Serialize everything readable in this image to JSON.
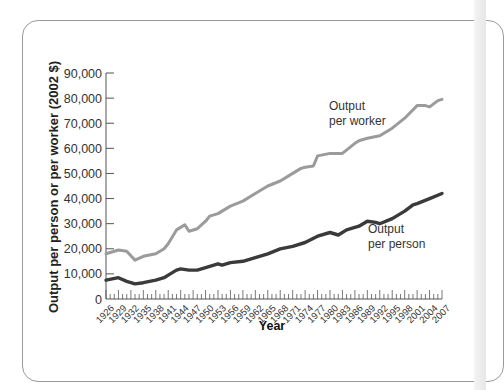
{
  "chart_data": {
    "type": "line",
    "title": "",
    "xlabel": "Year",
    "ylabel": "Output per person or per worker (2002 $)",
    "ylim": [
      0,
      90000
    ],
    "xlim": [
      1926,
      2007
    ],
    "grid": false,
    "y_ticks": [
      "0",
      "10,000",
      "20,000",
      "30,000",
      "40,000",
      "50,000",
      "60,000",
      "70,000",
      "80,000",
      "90,000"
    ],
    "x_ticks": [
      "1926",
      "1929",
      "1932",
      "1935",
      "1938",
      "1941",
      "1944",
      "1947",
      "1950",
      "1953",
      "1956",
      "1959",
      "1962",
      "1965",
      "1968",
      "1971",
      "1974",
      "1977",
      "1980",
      "1983",
      "1986",
      "1989",
      "1992",
      "1995",
      "1998",
      "2001",
      "2004",
      "2007"
    ],
    "series": [
      {
        "name": "Output per worker",
        "label_lines": [
          "Output",
          "per worker"
        ],
        "color": "#9b9b9b",
        "x": [
          1926,
          1929,
          1931,
          1933,
          1935,
          1938,
          1940,
          1941,
          1943,
          1945,
          1946,
          1948,
          1950,
          1951,
          1953,
          1954,
          1956,
          1959,
          1962,
          1965,
          1968,
          1971,
          1973,
          1974,
          1976,
          1977,
          1980,
          1983,
          1986,
          1987,
          1989,
          1992,
          1995,
          1998,
          2001,
          2003,
          2004,
          2006,
          2007
        ],
        "values": [
          18000,
          19500,
          19000,
          15500,
          17000,
          18000,
          20000,
          22000,
          27500,
          29500,
          27000,
          28000,
          31000,
          33000,
          34000,
          35000,
          37000,
          39000,
          42000,
          45000,
          47000,
          50000,
          52000,
          52500,
          53000,
          57000,
          58000,
          58000,
          62000,
          63000,
          64000,
          65000,
          68000,
          72000,
          77000,
          77000,
          76500,
          79000,
          79500
        ]
      },
      {
        "name": "Output per person",
        "label_lines": [
          "Output",
          "per person"
        ],
        "color": "#3a3a3a",
        "x": [
          1926,
          1929,
          1931,
          1933,
          1935,
          1938,
          1940,
          1941,
          1943,
          1944,
          1946,
          1948,
          1950,
          1953,
          1954,
          1956,
          1959,
          1962,
          1965,
          1968,
          1971,
          1974,
          1977,
          1980,
          1982,
          1984,
          1987,
          1989,
          1991,
          1992,
          1995,
          1998,
          2000,
          2001,
          2004,
          2007
        ],
        "values": [
          7500,
          8500,
          7000,
          6000,
          6500,
          7500,
          8500,
          9500,
          11500,
          12000,
          11500,
          11500,
          12500,
          14000,
          13500,
          14500,
          15000,
          16500,
          18000,
          20000,
          21000,
          22500,
          25000,
          26500,
          25500,
          27500,
          29000,
          31000,
          30500,
          30000,
          32000,
          35000,
          37500,
          38000,
          40000,
          42000
        ]
      }
    ]
  }
}
